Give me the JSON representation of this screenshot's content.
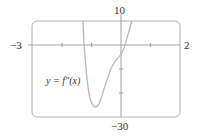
{
  "chart_data": {
    "type": "line",
    "title": "",
    "xlabel": "",
    "ylabel": "",
    "xlim": [
      -3,
      2
    ],
    "ylim": [
      -30,
      10
    ],
    "x_tick_labels": {
      "left": "−3",
      "right": "2"
    },
    "y_tick_labels": {
      "top": "10",
      "bottom": "−30"
    },
    "x_ticks": [
      -2,
      -1,
      0,
      1
    ],
    "y_ticks": [
      -10,
      -20
    ],
    "grid": false,
    "legend": null,
    "annotations": [
      {
        "text": "y = f″(x)",
        "x": -2.3,
        "y": -14
      }
    ],
    "series": [
      {
        "name": "y = f''(x)",
        "color": "#b8b8b8",
        "x": [
          -1.28,
          -1.24,
          -1.2,
          -1.16,
          -1.1,
          -1.02,
          -0.92,
          -0.84,
          -0.76,
          -0.66,
          -0.56,
          -0.45,
          -0.34,
          -0.2,
          -0.1,
          0.0,
          0.1,
          0.2,
          0.3,
          0.38
        ],
        "y": [
          10,
          0,
          -6,
          -12,
          -18,
          -23,
          -25.5,
          -25.8,
          -25,
          -22,
          -18,
          -14,
          -10,
          -7,
          -5.5,
          -4,
          -1.5,
          2.5,
          7,
          10
        ]
      }
    ]
  },
  "labels": {
    "x_min": "−3",
    "x_max": "2",
    "y_max": "10",
    "y_min": "−30",
    "curve": "y = f″(x)"
  },
  "colors": {
    "axes": "#a8a8a8",
    "curve": "#bcbcbc",
    "text": "#333333"
  }
}
